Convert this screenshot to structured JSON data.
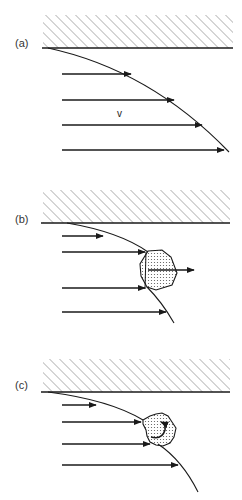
{
  "figure": {
    "panels": [
      {
        "id": "a",
        "label": "(a)",
        "velocity_label": "v",
        "arrows": 4,
        "description": "Velocity profile of flow along a wall with streamlines"
      },
      {
        "id": "b",
        "label": "(b)",
        "arrows": 4,
        "description": "Particle (stippled blob) at the velocity front being pushed forward"
      },
      {
        "id": "c",
        "label": "(c)",
        "arrows": 4,
        "description": "Particle (stippled blob) at the velocity front rotating"
      }
    ],
    "colors": {
      "line": "#1a1a1a",
      "hatch": "#444444",
      "stipple": "#555555",
      "background": "#ffffff"
    }
  }
}
